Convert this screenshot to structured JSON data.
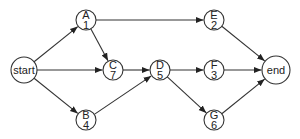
{
  "diagram": {
    "type": "activity-network",
    "nodes": [
      {
        "id": "start",
        "label": "start",
        "value": "",
        "x": 24,
        "y": 70,
        "r": 13
      },
      {
        "id": "A",
        "label": "A",
        "value": "1",
        "x": 86,
        "y": 20,
        "r": 10
      },
      {
        "id": "B",
        "label": "B",
        "value": "4",
        "x": 86,
        "y": 120,
        "r": 10
      },
      {
        "id": "C",
        "label": "C",
        "value": "7",
        "x": 113,
        "y": 70,
        "r": 10
      },
      {
        "id": "D",
        "label": "D",
        "value": "5",
        "x": 160,
        "y": 70,
        "r": 10
      },
      {
        "id": "E",
        "label": "E",
        "value": "2",
        "x": 214,
        "y": 20,
        "r": 10
      },
      {
        "id": "F",
        "label": "F",
        "value": "3",
        "x": 214,
        "y": 70,
        "r": 10
      },
      {
        "id": "G",
        "label": "G",
        "value": "6",
        "x": 214,
        "y": 120,
        "r": 10
      },
      {
        "id": "end",
        "label": "end",
        "value": "",
        "x": 276,
        "y": 70,
        "r": 14
      }
    ],
    "edges": [
      {
        "from": "start",
        "to": "A"
      },
      {
        "from": "start",
        "to": "C"
      },
      {
        "from": "start",
        "to": "B"
      },
      {
        "from": "A",
        "to": "C"
      },
      {
        "from": "A",
        "to": "E"
      },
      {
        "from": "C",
        "to": "D"
      },
      {
        "from": "B",
        "to": "D"
      },
      {
        "from": "D",
        "to": "F"
      },
      {
        "from": "D",
        "to": "G"
      },
      {
        "from": "E",
        "to": "end"
      },
      {
        "from": "F",
        "to": "end"
      },
      {
        "from": "G",
        "to": "end"
      }
    ]
  }
}
